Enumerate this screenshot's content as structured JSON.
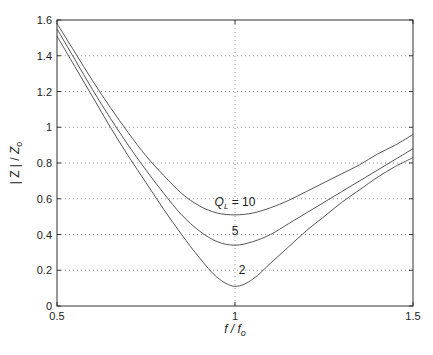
{
  "chart_data": {
    "type": "line",
    "title": "",
    "xlabel": "f / f_o",
    "ylabel": "| Z | / Z_o",
    "xlim": [
      0.5,
      1.5
    ],
    "ylim": [
      0,
      1.6
    ],
    "xticks": [
      0.5,
      1,
      1.5
    ],
    "xtick_labels": [
      "0.5",
      "1",
      "1.5"
    ],
    "yticks": [
      0,
      0.2,
      0.4,
      0.6,
      0.8,
      1,
      1.2,
      1.4,
      1.6
    ],
    "ytick_labels": [
      "0",
      "0.2",
      "0.4",
      "0.6",
      "0.8",
      "1",
      "1.2",
      "1.4",
      "1.6"
    ],
    "grid": true,
    "x": [
      0.5,
      0.55,
      0.6,
      0.65,
      0.7,
      0.75,
      0.8,
      0.85,
      0.9,
      0.95,
      1.0,
      1.05,
      1.1,
      1.15,
      1.2,
      1.25,
      1.3,
      1.35,
      1.4,
      1.45,
      1.5
    ],
    "series": [
      {
        "name": "Q_L = 10",
        "label": "Q_L = 10",
        "values": [
          1.58,
          1.42,
          1.26,
          1.11,
          0.97,
          0.84,
          0.73,
          0.63,
          0.56,
          0.52,
          0.51,
          0.52,
          0.55,
          0.59,
          0.64,
          0.69,
          0.74,
          0.79,
          0.85,
          0.9,
          0.96
        ]
      },
      {
        "name": "Q_L = 5",
        "label": "5",
        "values": [
          1.55,
          1.38,
          1.21,
          1.05,
          0.9,
          0.76,
          0.63,
          0.51,
          0.42,
          0.36,
          0.34,
          0.36,
          0.4,
          0.46,
          0.52,
          0.58,
          0.64,
          0.7,
          0.76,
          0.82,
          0.88
        ]
      },
      {
        "name": "Q_L = 2",
        "label": "2",
        "values": [
          1.51,
          1.34,
          1.17,
          1.0,
          0.84,
          0.69,
          0.54,
          0.4,
          0.27,
          0.16,
          0.11,
          0.15,
          0.24,
          0.33,
          0.42,
          0.5,
          0.58,
          0.65,
          0.72,
          0.78,
          0.83
        ]
      }
    ],
    "annotations": [
      {
        "text_main": "Q",
        "text_sub": "L",
        "text_rest": " = 10",
        "x": 1.0,
        "y": 0.56
      },
      {
        "text_main": "5",
        "x": 1.0,
        "y": 0.4
      },
      {
        "text_main": "2",
        "x": 1.02,
        "y": 0.18
      }
    ],
    "legend": "none"
  }
}
